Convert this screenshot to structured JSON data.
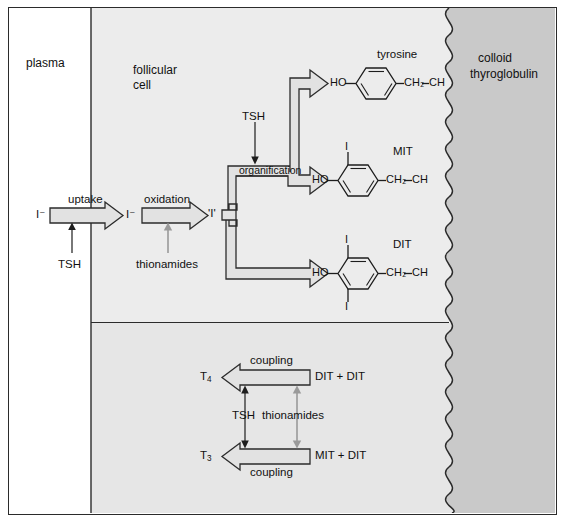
{
  "diagram": {
    "type": "biochemical-pathway-diagram",
    "width": 566,
    "height": 523
  },
  "regions": {
    "plasma": {
      "label": "plasma",
      "fill": "#ffffff"
    },
    "follicular_cell": {
      "label": "follicular\ncell",
      "label_line1": "follicular",
      "label_line2": "cell",
      "fill": "#ececec"
    },
    "colloid": {
      "label": "colloid\nthyroglobulin",
      "label_line1": "colloid",
      "label_line2": "thyroglobulin",
      "fill": "#c9c9c9"
    }
  },
  "transport_steps": [
    {
      "id": "uptake",
      "label": "uptake",
      "substrate": "I⁻",
      "product": "I⁻",
      "regulator": "TSH",
      "regulator_color": "#1d1d1d",
      "regulator_direction": "up"
    },
    {
      "id": "oxidation",
      "label": "oxidation",
      "substrate": "I⁻",
      "product": "'I'",
      "regulator": "thionamides",
      "regulator_color": "#9a9a9a",
      "regulator_direction": "up"
    }
  ],
  "organification": {
    "label": "organification",
    "input": "'I'",
    "regulator": "TSH",
    "regulator_color": "#1d1d1d",
    "outputs": [
      "tyrosine",
      "MIT",
      "DIT"
    ]
  },
  "residues": [
    {
      "name": "tyrosine",
      "hydroxyl": "HO",
      "ch2": "CH₂",
      "ch": "CH",
      "iodines": [],
      "iodine_label": "I"
    },
    {
      "name": "MIT",
      "hydroxyl": "HO",
      "ch2": "CH₂",
      "ch": "CH",
      "iodines": [
        "top"
      ],
      "iodine_label": "I"
    },
    {
      "name": "DIT",
      "hydroxyl": "HO",
      "ch2": "CH₂",
      "ch": "CH",
      "iodines": [
        "top",
        "bottom"
      ],
      "iodine_label": "I"
    }
  ],
  "coupling": {
    "regulators_label": "TSH  thionamides",
    "tsh_label": "TSH",
    "thionamides_label": "thionamides",
    "tsh_color": "#1d1d1d",
    "thionamides_color": "#9a9a9a",
    "reactions": [
      {
        "product": "T",
        "product_sub": "4",
        "arrow_label": "coupling",
        "reactants": "DIT + DIT",
        "label_position": "above"
      },
      {
        "product": "T",
        "product_sub": "3",
        "arrow_label": "coupling",
        "reactants": "MIT + DIT",
        "label_position": "below"
      }
    ]
  },
  "colors": {
    "outline": "#2b2b2b",
    "arrow_fill": "#e2e2e2",
    "plasma_fill": "#ffffff",
    "cell_fill": "#ececec",
    "cell_fill_lower": "#e6e6e6",
    "colloid_fill": "#c9c9c9",
    "text": "#111111",
    "gray_arrow": "#9a9a9a"
  }
}
